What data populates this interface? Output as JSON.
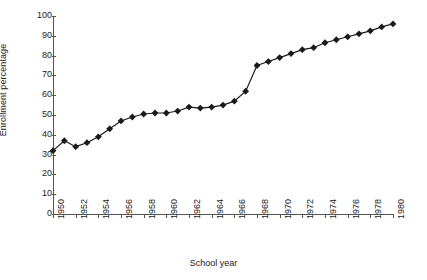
{
  "chart_data": {
    "type": "line",
    "title": "",
    "xlabel": "School year",
    "ylabel": "Enrollment percentage",
    "xlim": [
      1950,
      1980
    ],
    "ylim": [
      0,
      100
    ],
    "grid": false,
    "legend": "none",
    "marker": "diamond",
    "line_color": "#1a1a1a",
    "marker_color": "#1a1a1a",
    "x_tick_labels": [
      "1950",
      "1952",
      "1954",
      "1956",
      "1958",
      "1960",
      "1962",
      "1964",
      "1966",
      "1968",
      "1970",
      "1972",
      "1974",
      "1976",
      "1978",
      "1980"
    ],
    "x_tick_values": [
      1950,
      1952,
      1954,
      1956,
      1958,
      1960,
      1962,
      1964,
      1966,
      1968,
      1970,
      1972,
      1974,
      1976,
      1978,
      1980
    ],
    "y_tick_labels": [
      "0",
      "10",
      "20",
      "30",
      "40",
      "50",
      "60",
      "70",
      "80",
      "90",
      "100"
    ],
    "y_tick_values": [
      0,
      10,
      20,
      30,
      40,
      50,
      60,
      70,
      80,
      90,
      100
    ],
    "x": [
      1950,
      1951,
      1952,
      1953,
      1954,
      1955,
      1956,
      1957,
      1958,
      1959,
      1960,
      1961,
      1962,
      1963,
      1964,
      1965,
      1966,
      1967,
      1968,
      1969,
      1970,
      1971,
      1972,
      1973,
      1974,
      1975,
      1976,
      1977,
      1978,
      1979,
      1980
    ],
    "values": [
      32,
      37,
      34,
      36,
      39,
      43,
      47,
      49,
      50.5,
      51,
      51,
      52,
      54,
      53.5,
      54,
      55,
      57,
      62,
      75,
      77,
      79,
      81,
      83,
      84,
      86.5,
      88,
      89.5,
      91,
      92.5,
      94.5,
      96
    ],
    "series": [
      {
        "name": "Enrollment percentage",
        "values": [
          32,
          37,
          34,
          36,
          39,
          43,
          47,
          49,
          50.5,
          51,
          51,
          52,
          54,
          53.5,
          54,
          55,
          57,
          62,
          75,
          77,
          79,
          81,
          83,
          84,
          86.5,
          88,
          89.5,
          91,
          92.5,
          94.5,
          96
        ]
      }
    ]
  }
}
